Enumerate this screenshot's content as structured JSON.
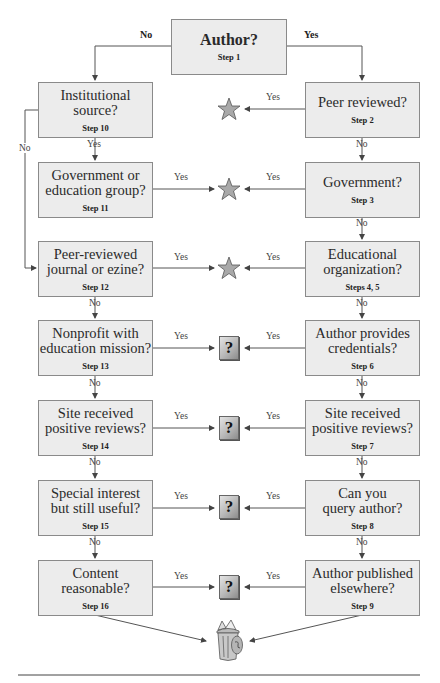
{
  "start": {
    "question": "Author?",
    "step": "Step 1",
    "no_label": "No",
    "yes_label": "Yes"
  },
  "left_column": [
    {
      "question": "Institutional source?",
      "lines": [
        "Institutional",
        "source?"
      ],
      "step": "Step 10"
    },
    {
      "question": "Government or education group?",
      "lines": [
        "Government or",
        "education group?"
      ],
      "step": "Step 11"
    },
    {
      "question": "Peer-reviewed journal or ezine?",
      "lines": [
        "Peer-reviewed",
        "journal or ezine?"
      ],
      "step": "Step 12"
    },
    {
      "question": "Nonprofit with education mission?",
      "lines": [
        "Nonprofit with",
        "education mission?"
      ],
      "step": "Step 13"
    },
    {
      "question": "Site received positive reviews?",
      "lines": [
        "Site received",
        "positive reviews?"
      ],
      "step": "Step 14"
    },
    {
      "question": "Special interest but still useful?",
      "lines": [
        "Special interest",
        "but still useful?"
      ],
      "step": "Step 15"
    },
    {
      "question": "Content reasonable?",
      "lines": [
        "Content",
        "reasonable?"
      ],
      "step": "Step 16"
    }
  ],
  "right_column": [
    {
      "question": "Peer reviewed?",
      "lines": [
        "Peer reviewed?"
      ],
      "step": "Step 2"
    },
    {
      "question": "Government?",
      "lines": [
        "Government?"
      ],
      "step": "Step 3"
    },
    {
      "question": "Educational organization?",
      "lines": [
        "Educational",
        "organization?"
      ],
      "step": "Steps 4, 5"
    },
    {
      "question": "Author provides credentials?",
      "lines": [
        "Author provides",
        "credentials?"
      ],
      "step": "Step 6"
    },
    {
      "question": "Site received positive reviews?",
      "lines": [
        "Site received",
        "positive reviews?"
      ],
      "step": "Step 7"
    },
    {
      "question": "Can you query author?",
      "lines": [
        "Can you",
        "query author?"
      ],
      "step": "Step 8"
    },
    {
      "question": "Author published elsewhere?",
      "lines": [
        "Author published",
        "elsewhere?"
      ],
      "step": "Step 9"
    }
  ],
  "edge_labels": {
    "yes": "Yes",
    "no": "No",
    "left_bypass": "No"
  },
  "outcomes": {
    "rows": [
      "star",
      "star",
      "star",
      "question",
      "question",
      "question",
      "question"
    ],
    "question_symbol": "?",
    "final": "trash-can"
  },
  "colors": {
    "box_fill": "#ececec",
    "box_border": "#8a8a8a",
    "line": "#555555",
    "star_fill": "#a9a9a9",
    "star_stroke": "#555555"
  }
}
